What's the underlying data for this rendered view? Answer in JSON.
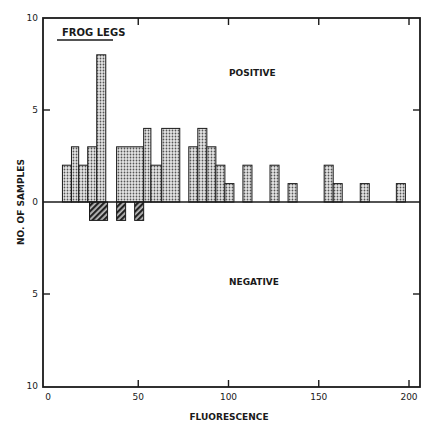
{
  "chart_data": {
    "type": "bar",
    "title": "",
    "inset_label": "FROG LEGS",
    "xlabel": "FLUORESCENCE",
    "ylabel": "NO. OF SAMPLES",
    "region_labels": {
      "positive": "POSITIVE",
      "negative": "NEGATIVE"
    },
    "xlim": [
      0,
      205
    ],
    "ylim": [
      -10,
      10
    ],
    "x_ticks": [
      0,
      50,
      100,
      150,
      200
    ],
    "y_ticks": [
      {
        "value": 10,
        "label": "10"
      },
      {
        "value": 5,
        "label": "5"
      },
      {
        "value": 0,
        "label": "0"
      },
      {
        "value": -5,
        "label": "5"
      },
      {
        "value": -10,
        "label": "10"
      }
    ],
    "grid": false,
    "legend": null,
    "series": [
      {
        "name": "POSITIVE",
        "style": "stippled",
        "bins": [
          {
            "x0": 8,
            "x1": 13,
            "count": 2
          },
          {
            "x0": 13,
            "x1": 17,
            "count": 3
          },
          {
            "x0": 17,
            "x1": 22,
            "count": 2
          },
          {
            "x0": 22,
            "x1": 27,
            "count": 3
          },
          {
            "x0": 27,
            "x1": 32,
            "count": 8
          },
          {
            "x0": 38,
            "x1": 53,
            "count": 3
          },
          {
            "x0": 53,
            "x1": 57,
            "count": 4
          },
          {
            "x0": 57,
            "x1": 63,
            "count": 2
          },
          {
            "x0": 63,
            "x1": 73,
            "count": 4
          },
          {
            "x0": 78,
            "x1": 83,
            "count": 3
          },
          {
            "x0": 83,
            "x1": 88,
            "count": 4
          },
          {
            "x0": 88,
            "x1": 93,
            "count": 3
          },
          {
            "x0": 93,
            "x1": 98,
            "count": 2
          },
          {
            "x0": 98,
            "x1": 103,
            "count": 1
          },
          {
            "x0": 108,
            "x1": 113,
            "count": 2
          },
          {
            "x0": 123,
            "x1": 128,
            "count": 2
          },
          {
            "x0": 133,
            "x1": 138,
            "count": 1
          },
          {
            "x0": 153,
            "x1": 158,
            "count": 2
          },
          {
            "x0": 158,
            "x1": 163,
            "count": 1
          },
          {
            "x0": 173,
            "x1": 178,
            "count": 1
          },
          {
            "x0": 193,
            "x1": 198,
            "count": 1
          }
        ]
      },
      {
        "name": "NEGATIVE",
        "style": "hatched",
        "bins": [
          {
            "x0": 23,
            "x1": 33,
            "count": 1
          },
          {
            "x0": 38,
            "x1": 43,
            "count": 1
          },
          {
            "x0": 48,
            "x1": 53,
            "count": 1
          }
        ]
      }
    ],
    "colors": {
      "positive_fill": "#d4d4d4",
      "negative_fill": "#3a3a3a",
      "axis": "#1a1a1a"
    }
  }
}
